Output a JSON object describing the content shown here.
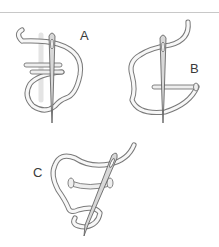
{
  "figure": {
    "panels": [
      {
        "id": "A",
        "label": "A"
      },
      {
        "id": "B",
        "label": "B"
      },
      {
        "id": "C",
        "label": "C"
      }
    ],
    "colors": {
      "outline": "#7a7a7a",
      "thread_fill": "#f7f7f7",
      "rule": "#c8c8c8",
      "label": "#3a3a3a"
    }
  }
}
